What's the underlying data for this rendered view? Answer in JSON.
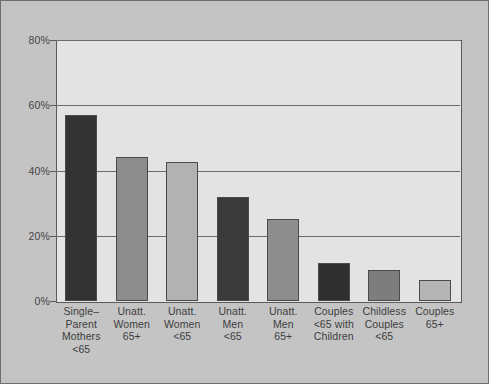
{
  "chart_data": {
    "type": "bar",
    "title": "",
    "subtitle": "",
    "xlabel": "",
    "ylabel": "",
    "ylim": [
      0,
      80
    ],
    "y_unit": "%",
    "grid": true,
    "legend": "none",
    "y_ticks": [
      "0%",
      "20%",
      "40%",
      "60%",
      "80%"
    ],
    "y_tick_values": [
      0,
      20,
      40,
      60,
      80
    ],
    "categories": [
      "Single–Parent Mothers <65",
      "Unatt. Women 65+",
      "Unatt. Women <65",
      "Unatt. Men <65",
      "Unatt. Men 65+",
      "Couples <65 with Children",
      "Childless Couples <65",
      "Couples 65+"
    ],
    "category_lines": [
      [
        "Single–",
        "Parent",
        "Mothers",
        "<65"
      ],
      [
        "Unatt.",
        "Women",
        "65+"
      ],
      [
        "Unatt.",
        "Women",
        "<65"
      ],
      [
        "Unatt.",
        "Men",
        "<65"
      ],
      [
        "Unatt.",
        "Men",
        "65+"
      ],
      [
        "Couples",
        "<65 with",
        "Children"
      ],
      [
        "Childless",
        "Couples",
        "<65"
      ],
      [
        "Couples",
        "65+"
      ]
    ],
    "values": [
      57,
      44,
      42.5,
      32,
      25,
      11.5,
      9.5,
      6.5
    ],
    "bar_colors": [
      "#333333",
      "#8d8d8d",
      "#b2b2b2",
      "#3a3a3a",
      "#8d8d8d",
      "#2f2f2f",
      "#7d7d7d",
      "#b4b4b4"
    ]
  },
  "figure": {
    "background": "#c4c4c4",
    "plot_background": "#e3e3e3",
    "axis_color": "#5a5a5a",
    "grid_color": "#6a6a6a"
  }
}
